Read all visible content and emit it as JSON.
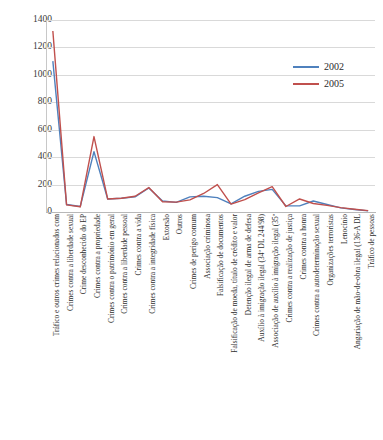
{
  "chart_data": {
    "type": "line",
    "title": "",
    "xlabel": "",
    "ylabel": "",
    "ylim": [
      0,
      1400
    ],
    "ytick_step": 200,
    "yticks": [
      1400,
      1200,
      1000,
      800,
      600,
      400,
      200,
      0
    ],
    "grid": true,
    "legend_position": "upper-right",
    "categories": [
      "Tráfico e outros crimes relacionados com",
      "Crimes contra a liberdade sexual",
      "Crime desconhecido do EP",
      "Crimes contra a propriedade",
      "Crimes contra o património em geral",
      "Crimes contra a liberdade pessoal",
      "Crimes contra a vida",
      "Crimes contra a integridade física",
      "Extorsão",
      "Outros",
      "Crimes de perigo comum",
      "Associação criminosa",
      "Falsificação de documentos",
      "Falsificação de moeda, título de crédito e valor",
      "Detenção ilegal de arma de defesa",
      "Auxílio à imigração ilegal (34º DL 244/98)",
      "Associação de auxílio à imigração ilegal (35º",
      "Crimes contra a realização de justiça",
      "Crimes contra a honra",
      "Crimes contra a autodeterminação sexual",
      "Organizações terroristas",
      "Lenocínio",
      "Angariação de mão-de-obra ilegal (136-A DL",
      "Tráfico de pessoas"
    ],
    "series": [
      {
        "name": "2002",
        "color": "#4F81BD",
        "values": [
          1100,
          55,
          40,
          440,
          95,
          100,
          110,
          175,
          80,
          70,
          110,
          115,
          105,
          60,
          115,
          150,
          165,
          45,
          45,
          80,
          55,
          30,
          18,
          8
        ]
      },
      {
        "name": "2005",
        "color": "#C0504D",
        "values": [
          1320,
          52,
          38,
          550,
          95,
          100,
          115,
          178,
          75,
          72,
          88,
          135,
          200,
          58,
          90,
          140,
          185,
          40,
          95,
          62,
          48,
          32,
          20,
          10
        ]
      }
    ]
  },
  "legend": {
    "entries": [
      {
        "label": "2002",
        "color": "#4F81BD"
      },
      {
        "label": "2005",
        "color": "#C0504D"
      }
    ]
  }
}
